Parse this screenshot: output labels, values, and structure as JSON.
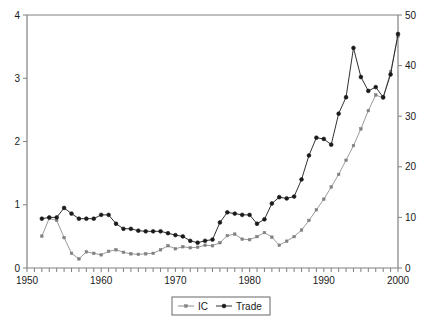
{
  "chart_data": {
    "type": "line",
    "title": "",
    "subtitle": "",
    "xlabel": "",
    "ylabel": "",
    "y2label": "",
    "grid": false,
    "legend_position": "bottom-center",
    "xlim": [
      1950,
      2000
    ],
    "ylim": [
      0,
      4
    ],
    "y2lim": [
      0,
      50
    ],
    "x_tick_interval": 1,
    "x_label_interval": 10,
    "xticklabels": [
      "1950",
      "1960",
      "1970",
      "1980",
      "1990",
      "2000"
    ],
    "xtick_label_values": [
      1950,
      1960,
      1970,
      1980,
      1990,
      2000
    ],
    "yticklabels": [
      "0",
      "1",
      "2",
      "3",
      "4"
    ],
    "ytick_values": [
      0,
      1,
      2,
      3,
      4
    ],
    "y2ticklabels": [
      "0",
      "10",
      "20",
      "30",
      "40",
      "50"
    ],
    "y2tick_values": [
      0,
      10,
      20,
      30,
      40,
      50
    ],
    "x": [
      1952,
      1953,
      1954,
      1955,
      1956,
      1957,
      1958,
      1959,
      1960,
      1961,
      1962,
      1963,
      1964,
      1965,
      1966,
      1967,
      1968,
      1969,
      1970,
      1971,
      1972,
      1973,
      1974,
      1975,
      1976,
      1977,
      1978,
      1979,
      1980,
      1981,
      1982,
      1983,
      1984,
      1985,
      1986,
      1987,
      1988,
      1989,
      1990,
      1991,
      1992,
      1993,
      1994,
      1995,
      1996,
      1997,
      1998,
      1999,
      2000
    ],
    "series": [
      {
        "name": "IC",
        "axis": "right",
        "color": "#808080",
        "marker": "small-square",
        "units": "percent",
        "values": [
          6.3,
          9.8,
          9.4,
          6.0,
          2.9,
          1.8,
          3.2,
          2.9,
          2.6,
          3.3,
          3.6,
          3.1,
          2.8,
          2.7,
          2.8,
          2.9,
          3.6,
          4.4,
          3.8,
          4.2,
          4.0,
          4.1,
          4.5,
          4.4,
          5.0,
          6.4,
          6.7,
          5.7,
          5.6,
          6.2,
          7.0,
          6.1,
          4.5,
          5.3,
          6.2,
          7.5,
          9.4,
          11.5,
          13.6,
          16.0,
          18.5,
          21.3,
          24.2,
          27.5,
          31.1,
          34.2,
          33.6,
          38.8,
          45.8
        ]
      },
      {
        "name": "Trade",
        "axis": "left",
        "color": "#1a1a1a",
        "marker": "filled-diamond",
        "units": "index",
        "values": [
          0.78,
          0.8,
          0.8,
          0.95,
          0.86,
          0.78,
          0.78,
          0.78,
          0.84,
          0.84,
          0.7,
          0.62,
          0.62,
          0.59,
          0.58,
          0.58,
          0.58,
          0.55,
          0.52,
          0.5,
          0.43,
          0.4,
          0.43,
          0.45,
          0.72,
          0.88,
          0.86,
          0.84,
          0.84,
          0.7,
          0.77,
          1.02,
          1.12,
          1.1,
          1.13,
          1.4,
          1.78,
          2.06,
          2.04,
          1.95,
          2.44,
          2.7,
          3.48,
          3.02,
          2.8,
          2.86,
          2.7,
          3.06,
          3.7
        ]
      }
    ],
    "legend_entries": [
      "IC",
      "Trade"
    ],
    "colors": {
      "ic": "#808080",
      "trade": "#1a1a1a",
      "axis": "#808080",
      "text": "#1a1a1a",
      "background": "#ffffff"
    }
  },
  "legend": {
    "items": [
      {
        "label": "IC"
      },
      {
        "label": "Trade"
      }
    ]
  }
}
